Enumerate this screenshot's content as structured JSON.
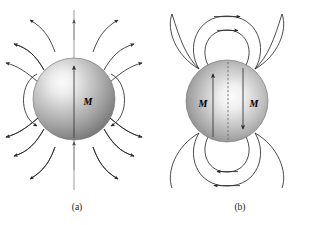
{
  "figure": {
    "background_color": "#ffffff",
    "line_color": "#2b2b2b",
    "faint_line_color": "#8d8d8d",
    "label_color": "#000000"
  },
  "panels": [
    {
      "id": "a",
      "caption": "(a)",
      "caption_x": 77,
      "caption_y": 210,
      "field_type": "radial-dipole-B-field",
      "sphere": {
        "cx": 74,
        "cy": 99,
        "r": 41,
        "highlight_cx": 55,
        "highlight_cy": 80,
        "fill_light": "#f2f2f2",
        "fill_mid": "#b4b4b4",
        "fill_dark": "#6f6f6f"
      },
      "magnetization_labels": [
        {
          "text": "M",
          "x": 88,
          "y": 105
        }
      ],
      "interior_arrows": [
        {
          "direction": "up",
          "x": 74,
          "y_tail": 138,
          "y_head": 62
        }
      ],
      "axis": {
        "x": 74,
        "y_top": 10,
        "y_bottom": 190,
        "arrow_positions": [
          26,
          72,
          147
        ]
      }
    },
    {
      "id": "b",
      "caption": "(b)",
      "caption_x": 240,
      "caption_y": 210,
      "field_type": "toroidal-H-field",
      "sphere": {
        "cx": 227,
        "cy": 101,
        "r": 41,
        "highlight_cx": 244,
        "highlight_cy": 96,
        "fill_light": "#f4f4f4",
        "fill_mid": "#b0b0b0",
        "fill_dark": "#6a6a6a"
      },
      "magnetization_labels": [
        {
          "text": "M",
          "x": 206,
          "y": 107
        },
        {
          "text": "M",
          "x": 252,
          "y": 107
        }
      ],
      "interior_arrows": [
        {
          "direction": "up",
          "x": 213,
          "y_tail": 137,
          "y_head": 70
        },
        {
          "direction": "down",
          "x": 243,
          "y_tail": 68,
          "y_head": 133
        }
      ],
      "center_dashed_axis": {
        "x": 228,
        "y_top": 62,
        "y_bottom": 140
      }
    }
  ],
  "icons": {
    "arrow_head": "triangle-arrowhead"
  }
}
